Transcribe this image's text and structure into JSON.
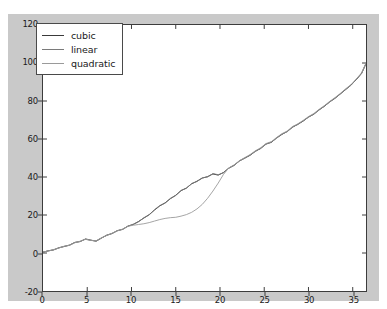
{
  "chart_data": {
    "type": "line",
    "title": "",
    "xlabel": "",
    "ylabel": "",
    "xlim": [
      0,
      36.5
    ],
    "ylim": [
      -20,
      120
    ],
    "grid": false,
    "legend_position": "upper left",
    "xticks": [
      "0",
      "5",
      "10",
      "15",
      "20",
      "25",
      "30",
      "35"
    ],
    "xtick_values": [
      0,
      5,
      10,
      15,
      20,
      25,
      30,
      35
    ],
    "yticks": [
      "-20",
      "0",
      "20",
      "40",
      "60",
      "80",
      "100",
      "120"
    ],
    "ytick_values": [
      -20,
      0,
      20,
      40,
      60,
      80,
      100,
      120
    ],
    "series": [
      {
        "name": "cubic",
        "color": "#3a3a3a",
        "linewidth": 1.0,
        "x": [
          0,
          0.6,
          1.2,
          1.8,
          2.4,
          3.0,
          3.6,
          4.2,
          4.8,
          5.4,
          6.0,
          6.6,
          7.2,
          7.8,
          8.4,
          9.0,
          9.6,
          10.2,
          10.8,
          11.4,
          12.0,
          12.6,
          13.2,
          13.8,
          14.4,
          15.0,
          15.6,
          16.2,
          16.8,
          17.4,
          18.0,
          18.6,
          19.2,
          19.8,
          20.4,
          21.0,
          21.6,
          22.2,
          22.8,
          23.4,
          24.0,
          24.6,
          25.2,
          25.8,
          26.4,
          27.0,
          27.6,
          28.2,
          28.8,
          29.4,
          30.0,
          30.6,
          31.2,
          31.8,
          32.4,
          33.0,
          33.6,
          34.2,
          34.8,
          35.4,
          36.0,
          36.5
        ],
        "y": [
          0.4,
          1.2,
          1.6,
          2.8,
          3.4,
          4.2,
          5.6,
          6.0,
          7.4,
          6.8,
          6.2,
          7.8,
          9.4,
          10.2,
          11.8,
          12.4,
          14.2,
          15.0,
          16.6,
          18.4,
          20.2,
          22.6,
          24.8,
          26.4,
          28.6,
          30.4,
          32.8,
          34.2,
          36.4,
          37.8,
          39.4,
          40.2,
          41.6,
          41.0,
          42.4,
          44.6,
          46.2,
          48.4,
          50.0,
          51.4,
          53.6,
          55.0,
          57.4,
          58.2,
          60.6,
          62.4,
          64.0,
          66.2,
          67.8,
          69.4,
          71.6,
          73.0,
          75.4,
          77.2,
          79.6,
          81.4,
          83.8,
          86.0,
          88.4,
          91.2,
          94.6,
          99.6
        ]
      },
      {
        "name": "linear",
        "color": "#7a7a7a",
        "linewidth": 0.9,
        "x": [
          0,
          0.6,
          1.2,
          1.8,
          2.4,
          3.0,
          3.6,
          4.2,
          4.8,
          5.4,
          6.0,
          6.6,
          7.2,
          7.8,
          8.4,
          9.0,
          9.6,
          10.2,
          10.8,
          11.4,
          12.0,
          12.6,
          13.2,
          13.8,
          14.4,
          15.0,
          15.6,
          16.2,
          16.8,
          17.4,
          18.0,
          18.6,
          19.2,
          19.8,
          20.4,
          21.0,
          21.6,
          22.2,
          22.8,
          23.4,
          24.0,
          24.6,
          25.2,
          25.8,
          26.4,
          27.0,
          27.6,
          28.2,
          28.8,
          29.4,
          30.0,
          30.6,
          31.2,
          31.8,
          32.4,
          33.0,
          33.6,
          34.2,
          34.8,
          35.4,
          36.0,
          36.5
        ],
        "y": [
          0.6,
          1.0,
          1.8,
          2.6,
          3.6,
          4.0,
          5.4,
          6.2,
          7.2,
          6.6,
          6.4,
          8.0,
          9.2,
          10.4,
          11.6,
          12.6,
          14.0,
          15.2,
          16.4,
          18.6,
          20.0,
          22.8,
          25.0,
          26.2,
          28.8,
          30.2,
          33.0,
          34.0,
          36.6,
          37.6,
          39.6,
          40.0,
          41.8,
          41.2,
          42.2,
          44.8,
          46.0,
          48.6,
          49.8,
          51.6,
          53.4,
          55.2,
          57.2,
          58.4,
          60.4,
          62.6,
          63.8,
          66.4,
          67.6,
          69.6,
          71.4,
          73.2,
          75.2,
          77.4,
          79.4,
          81.6,
          83.6,
          86.2,
          88.2,
          91.4,
          94.4,
          99.8
        ]
      },
      {
        "name": "quadratic",
        "color": "#9a9a9a",
        "linewidth": 0.9,
        "x": [
          0,
          0.6,
          1.2,
          1.8,
          2.4,
          3.0,
          3.6,
          4.2,
          4.8,
          5.4,
          6.0,
          6.6,
          7.2,
          7.8,
          8.4,
          9.0,
          9.6,
          10.2,
          10.8,
          11.4,
          12.0,
          12.6,
          13.2,
          13.8,
          14.4,
          15.0,
          15.6,
          16.2,
          16.8,
          17.4,
          18.0,
          18.6,
          19.2,
          19.8,
          20.4,
          21.0,
          21.6,
          22.2,
          22.8,
          23.4,
          24.0,
          24.6,
          25.2,
          25.8,
          26.4,
          27.0,
          27.6,
          28.2,
          28.8,
          29.4,
          30.0,
          30.6,
          31.2,
          31.8,
          32.4,
          33.0,
          33.6,
          34.2,
          34.8,
          35.4,
          36.0,
          36.5
        ],
        "y": [
          0.5,
          1.1,
          1.7,
          2.7,
          3.5,
          4.1,
          5.5,
          6.1,
          7.3,
          6.7,
          6.3,
          7.9,
          9.3,
          10.3,
          11.7,
          12.5,
          14.1,
          14.6,
          15.0,
          15.4,
          16.0,
          16.8,
          17.6,
          18.2,
          18.6,
          18.8,
          19.4,
          20.2,
          21.4,
          23.2,
          25.6,
          28.8,
          32.6,
          36.8,
          41.4,
          44.8,
          46.4,
          48.6,
          50.2,
          51.8,
          53.8,
          55.4,
          57.6,
          58.6,
          60.8,
          62.8,
          64.2,
          66.6,
          68.0,
          69.8,
          71.8,
          73.4,
          75.6,
          77.6,
          79.8,
          81.8,
          84.0,
          86.4,
          88.6,
          91.6,
          94.8,
          100.0
        ]
      }
    ]
  },
  "legend": {
    "entries": [
      {
        "label": "cubic"
      },
      {
        "label": "linear"
      },
      {
        "label": "quadratic"
      }
    ]
  }
}
